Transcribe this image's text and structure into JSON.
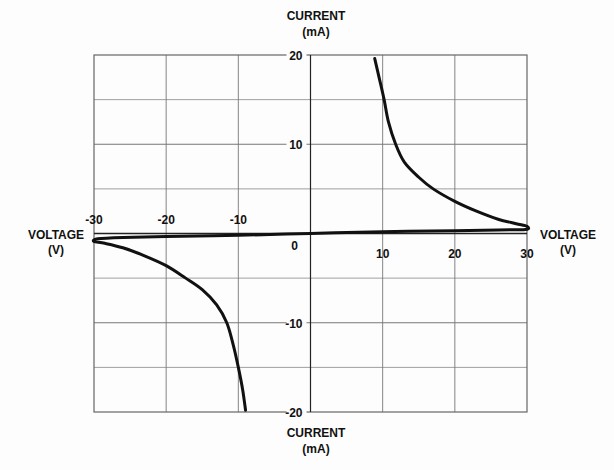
{
  "chart_data": {
    "type": "line",
    "title": "",
    "xlabel": "VOLTAGE (V)",
    "ylabel": "CURRENT (mA)",
    "xlim": [
      -30,
      30
    ],
    "ylim": [
      -20,
      20
    ],
    "grid": true,
    "x_ticks": [
      -30,
      -20,
      -10,
      0,
      10,
      20,
      30
    ],
    "y_ticks": [
      20,
      10,
      0,
      -10,
      -20
    ],
    "x_grid_step": 10,
    "y_grid_step": 5,
    "series": [
      {
        "name": "I-V characteristic",
        "points": [
          [
            -9.0,
            -19.8
          ],
          [
            -9.4,
            -17.5
          ],
          [
            -10.0,
            -15.0
          ],
          [
            -10.7,
            -12.5
          ],
          [
            -11.6,
            -10.0
          ],
          [
            -13.0,
            -8.0
          ],
          [
            -15.0,
            -6.3
          ],
          [
            -17.3,
            -5.0
          ],
          [
            -20.0,
            -3.6
          ],
          [
            -23.0,
            -2.5
          ],
          [
            -26.0,
            -1.6
          ],
          [
            -28.5,
            -1.1
          ],
          [
            -30.0,
            -0.9
          ],
          [
            -29.5,
            -0.6
          ],
          [
            -26.0,
            -0.45
          ],
          [
            -20.0,
            -0.35
          ],
          [
            -10.0,
            -0.2
          ],
          [
            0.0,
            0.0
          ],
          [
            10.0,
            0.2
          ],
          [
            20.0,
            0.3
          ],
          [
            26.0,
            0.4
          ],
          [
            29.8,
            0.45
          ],
          [
            30.0,
            0.8
          ],
          [
            28.5,
            1.1
          ],
          [
            26.0,
            1.6
          ],
          [
            23.0,
            2.5
          ],
          [
            20.0,
            3.6
          ],
          [
            17.0,
            5.0
          ],
          [
            15.0,
            6.3
          ],
          [
            13.0,
            8.0
          ],
          [
            11.8,
            10.0
          ],
          [
            10.8,
            12.5
          ],
          [
            10.2,
            15.0
          ],
          [
            9.5,
            17.5
          ],
          [
            8.9,
            19.6
          ]
        ]
      }
    ]
  },
  "labels": {
    "y_axis_top_line1": "CURRENT",
    "y_axis_top_line2": "(mA)",
    "y_axis_bottom_line1": "CURRENT",
    "y_axis_bottom_line2": "(mA)",
    "x_axis_left_line1": "VOLTAGE",
    "x_axis_left_line2": "(V)",
    "x_axis_right_line1": "VOLTAGE",
    "x_axis_right_line2": "(V)"
  },
  "colors": {
    "curve": "#111111",
    "grid": "#777777",
    "axis": "#222222",
    "background": "#fdfdfd"
  }
}
